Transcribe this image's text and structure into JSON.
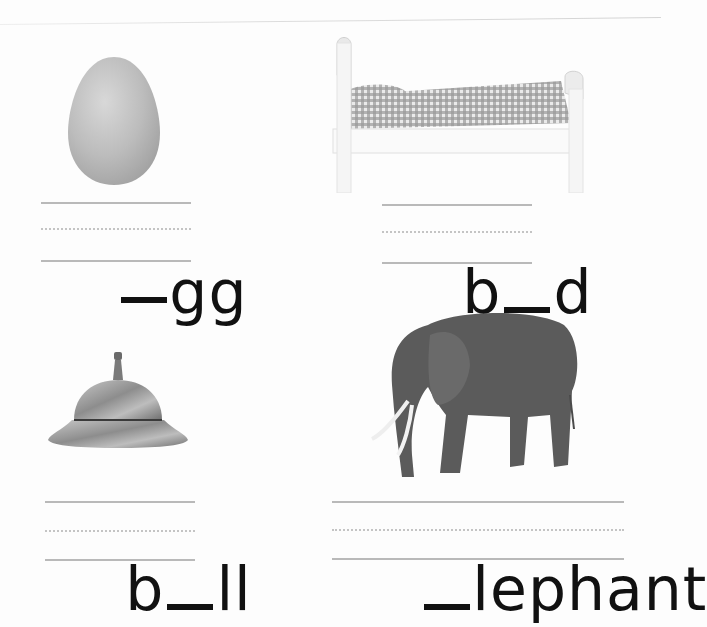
{
  "worksheet": {
    "items": [
      {
        "picture": "egg",
        "prefix": "",
        "suffix": "gg",
        "answer_blank": "_",
        "word_display": "_gg"
      },
      {
        "picture": "bed",
        "prefix": "b",
        "suffix": "d",
        "answer_blank": "_",
        "word_display": "b_d"
      },
      {
        "picture": "bell",
        "prefix": "b",
        "suffix": "ll",
        "answer_blank": "_",
        "word_display": "b_ll"
      },
      {
        "picture": "elephant",
        "prefix": "",
        "suffix": "lephant",
        "answer_blank": "_",
        "word_display": "_lephant"
      }
    ]
  },
  "colors": {
    "text": "#111111",
    "guide_line": "#b9b9b9",
    "dotted_line": "#c4c4c4",
    "egg": "#bdbdbd",
    "bell": "#9a9a9a",
    "elephant": "#5a5a5a",
    "gingham": "#8a8a8a"
  }
}
